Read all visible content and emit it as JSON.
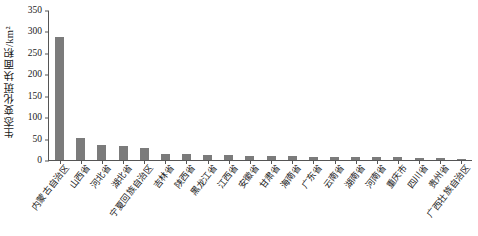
{
  "chart_data": {
    "type": "bar",
    "title": "",
    "xlabel": "",
    "ylabel": "生态变化斑块面积/km²",
    "ylim": [
      0,
      350
    ],
    "yticks": [
      0,
      50,
      100,
      150,
      200,
      250,
      300,
      350
    ],
    "grid": false,
    "legend": null,
    "bar_color": "#7b7b7b",
    "categories": [
      "内蒙古自治区",
      "山西省",
      "河北省",
      "湖北省",
      "宁夏回族自治区",
      "吉林省",
      "陕西省",
      "黑龙江省",
      "江西省",
      "安徽省",
      "甘肃省",
      "海南省",
      "广东省",
      "云南省",
      "湖南省",
      "河南省",
      "重庆市",
      "四川省",
      "贵州省",
      "广西壮族自治区"
    ],
    "values": [
      286,
      51,
      35,
      32,
      28,
      14,
      13,
      12,
      11,
      10,
      9,
      9,
      8,
      8,
      7,
      7,
      6,
      5,
      4,
      3
    ]
  }
}
